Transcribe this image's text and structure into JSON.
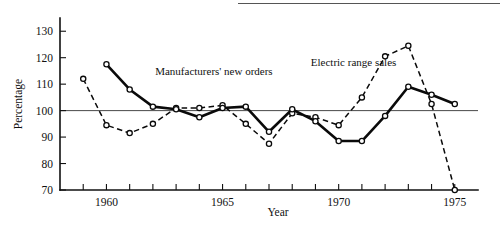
{
  "chart_data": {
    "type": "line",
    "title": "",
    "subtitle": "",
    "xlabel": "Year",
    "ylabel": "Percentage",
    "xlim": [
      1958,
      1976
    ],
    "ylim": [
      70,
      135
    ],
    "grid": false,
    "legend_position": "inline-annotation",
    "reference_line": {
      "axis": "y",
      "value": 100,
      "label": "100"
    },
    "y_ticks": [
      70,
      80,
      90,
      100,
      110,
      120,
      130
    ],
    "y_tick_labels": [
      "70",
      "80",
      "90",
      "100",
      "110",
      "120",
      "130"
    ],
    "x_ticks": [
      1959,
      1960,
      1961,
      1962,
      1963,
      1964,
      1965,
      1966,
      1967,
      1968,
      1969,
      1970,
      1971,
      1972,
      1973,
      1974,
      1975
    ],
    "x_tick_labels_shown": [
      "1960",
      "1965",
      "1970",
      "1975"
    ],
    "x_labeled_ticks": [
      1960,
      1965,
      1970,
      1975
    ],
    "series": [
      {
        "name": "Manufacturers' new orders",
        "style": "solid",
        "marker": "open-circle",
        "x": [
          1960,
          1961,
          1962,
          1963,
          1964,
          1965,
          1966,
          1967,
          1968,
          1969,
          1970,
          1971,
          1972,
          1973,
          1974,
          1975
        ],
        "values": [
          117.5,
          108.0,
          101.5,
          100.5,
          97.5,
          101.0,
          101.5,
          92.0,
          100.5,
          96.0,
          88.5,
          88.5,
          98.0,
          109.0,
          106.0,
          102.5
        ]
      },
      {
        "name": "Electric range sales",
        "style": "dashed",
        "marker": "open-circle",
        "x": [
          1959,
          1960,
          1961,
          1962,
          1963,
          1964,
          1965,
          1966,
          1967,
          1968,
          1969,
          1970,
          1971,
          1972,
          1973,
          1974,
          1975
        ],
        "values": [
          112.0,
          94.5,
          91.5,
          95.0,
          101.0,
          101.0,
          102.0,
          95.0,
          87.5,
          99.0,
          97.5,
          94.5,
          105.0,
          120.5,
          124.5,
          102.5,
          70.0
        ]
      }
    ],
    "annotations": [
      {
        "text": "Manufacturers' new orders",
        "x": 1962.1,
        "y": 113.5
      },
      {
        "text": "Electric range sales",
        "x": 1968.8,
        "y": 117.0
      }
    ],
    "colors": {
      "ink": "#0a0a0a",
      "axis": "#111111",
      "reference": "#333333",
      "background": "#ffffff",
      "marker_fill": "#ffffff"
    }
  }
}
